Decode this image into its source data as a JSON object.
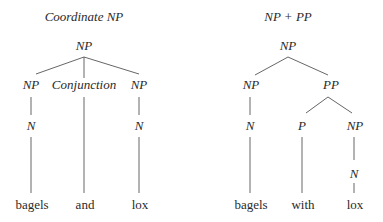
{
  "trees": [
    {
      "title": "Coordinate NP",
      "root": "NP",
      "level1": [
        "NP",
        "Conjunction",
        "NP"
      ],
      "level2": [
        "N",
        "N"
      ],
      "words": [
        "bagels",
        "and",
        "lox"
      ]
    },
    {
      "title": "NP + PP",
      "root": "NP",
      "level1": [
        "NP",
        "PP"
      ],
      "level2": [
        "N",
        "P",
        "NP"
      ],
      "level3": [
        "N"
      ],
      "words": [
        "bagels",
        "with",
        "lox"
      ]
    }
  ],
  "colors": {
    "text": "#2a2a2a",
    "edge": "#555555",
    "background": "#ffffff"
  }
}
